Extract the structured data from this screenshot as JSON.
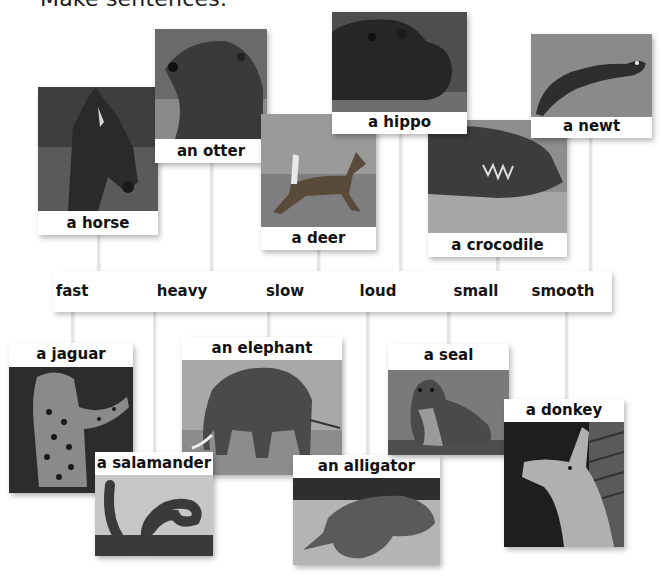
{
  "instruction": "Make sentences.",
  "adjectives": [
    {
      "word": "fast",
      "x": 72
    },
    {
      "word": "heavy",
      "x": 182
    },
    {
      "word": "slow",
      "x": 285
    },
    {
      "word": "loud",
      "x": 378
    },
    {
      "word": "small",
      "x": 476
    },
    {
      "word": "smooth",
      "x": 563
    }
  ],
  "top_cards": [
    {
      "label": "a horse",
      "icon": "horse-photo",
      "left": 38,
      "top": 87,
      "width": 120,
      "photo_h": 124,
      "connector_x": 98
    },
    {
      "label": "an otter",
      "icon": "otter-photo",
      "left": 155,
      "top": 29,
      "width": 112,
      "photo_h": 110,
      "connector_x": 211
    },
    {
      "label": "a deer",
      "icon": "deer-photo",
      "left": 261,
      "top": 114,
      "width": 115,
      "photo_h": 113,
      "connector_x": 318
    },
    {
      "label": "a hippo",
      "icon": "hippo-photo",
      "left": 332,
      "top": 12,
      "width": 135,
      "photo_h": 100,
      "connector_x": 400
    },
    {
      "label": "a crocodile",
      "icon": "crocodile-photo",
      "left": 428,
      "top": 120,
      "width": 139,
      "photo_h": 113,
      "connector_x": 497
    },
    {
      "label": "a newt",
      "icon": "newt-photo",
      "left": 531,
      "top": 34,
      "width": 121,
      "photo_h": 83,
      "connector_x": 590
    }
  ],
  "bottom_cards": [
    {
      "label": "a jaguar",
      "icon": "jaguar-photo",
      "left": 9,
      "top": 343,
      "width": 124,
      "photo_h": 126,
      "connector_x": 72
    },
    {
      "label": "an elephant",
      "icon": "elephant-photo",
      "left": 182,
      "top": 337,
      "width": 160,
      "photo_h": 115,
      "connector_x": 154
    },
    {
      "label": "a salamander",
      "icon": "salamander-photo",
      "left": 95,
      "top": 452,
      "width": 118,
      "photo_h": 81,
      "connector_x": 154
    },
    {
      "label": "an alligator",
      "icon": "alligator-photo",
      "left": 293,
      "top": 455,
      "width": 147,
      "photo_h": 87,
      "connector_x": 367
    },
    {
      "label": "a seal",
      "icon": "seal-photo",
      "left": 388,
      "top": 344,
      "width": 121,
      "photo_h": 85,
      "connector_x": 448
    },
    {
      "label": "a donkey",
      "icon": "donkey-photo",
      "left": 504,
      "top": 399,
      "width": 120,
      "photo_h": 125,
      "connector_x": 566
    }
  ],
  "bottom_connectors": [
    72,
    154,
    268,
    367,
    448,
    566
  ],
  "colors": {
    "line": "#e4e4e4",
    "text": "#111111",
    "background": "#ffffff"
  }
}
